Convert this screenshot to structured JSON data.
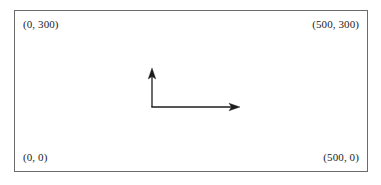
{
  "figure": {
    "background_color": "#ffffff",
    "frame": {
      "border_color": "#6b6b6b",
      "fill_color": "#ffffff"
    },
    "ink_color": "#1c1c1c"
  },
  "corner_labels": {
    "top_left": "(0, 300)",
    "top_right": "(500, 300)",
    "bottom_left": "(0, 0)",
    "bottom_right": "(500, 0)"
  },
  "axes": {
    "origin": {
      "x": 152,
      "y": 107
    },
    "y_axis": {
      "tip_x": 152,
      "tip_y": 68,
      "direction": "up"
    },
    "x_axis": {
      "tip_x": 240,
      "tip_y": 107,
      "direction": "right"
    },
    "stroke_color": "#1c1c1c",
    "stroke_width": 1.3
  },
  "chart_data": {
    "type": "scatter",
    "title": "",
    "xlabel": "",
    "ylabel": "",
    "xlim": [
      0,
      500
    ],
    "ylim": [
      0,
      300
    ],
    "grid": false,
    "legend": null,
    "annotations": [
      {
        "text": "(0, 300)",
        "corner": "top-left",
        "x": 0,
        "y": 300
      },
      {
        "text": "(500, 300)",
        "corner": "top-right",
        "x": 500,
        "y": 300
      },
      {
        "text": "(0, 0)",
        "corner": "bottom-left",
        "x": 0,
        "y": 0
      },
      {
        "text": "(500, 0)",
        "corner": "bottom-right",
        "x": 500,
        "y": 0
      }
    ],
    "series": []
  }
}
